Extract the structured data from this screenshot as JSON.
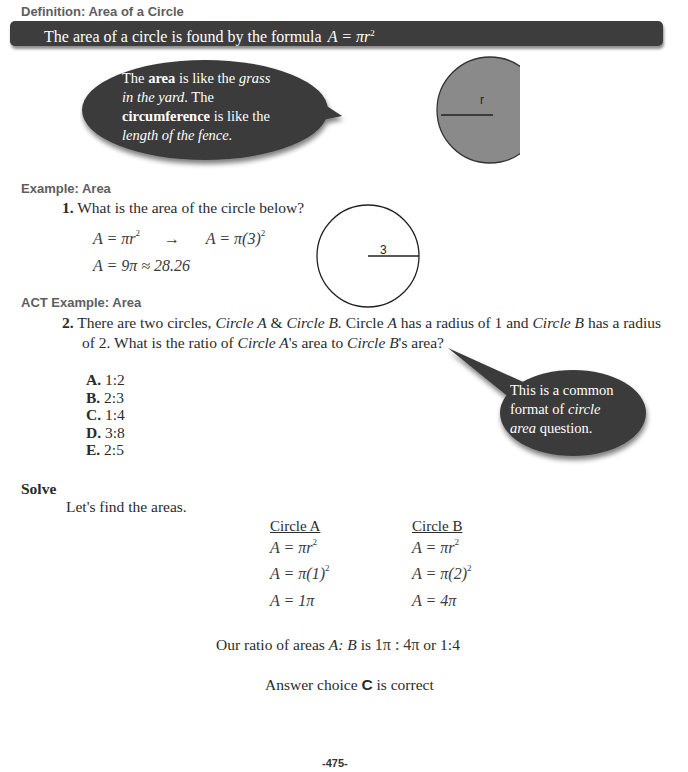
{
  "definition": {
    "heading": "Definition:  Area of a Circle",
    "bar_text": "The area of a circle is found by the formula",
    "bar_formula": "A = πr",
    "bar_formula_exp": "2"
  },
  "callout_1": {
    "line1_pre": "The ",
    "line1_bold": "area",
    "line1_mid": " is like the ",
    "line1_ital": "grass",
    "line2_ital": "in the yard",
    "line2_post": ".  The",
    "line3_bold": "circumference",
    "line3_post": " is like the",
    "line4_ital": "length of the fence."
  },
  "figure_1": {
    "label": "r",
    "fill": "#8a8a8a"
  },
  "example": {
    "heading": "Example:  Area",
    "number": "1.",
    "question": "What is the area of the circle below?",
    "step1_left": "A = πr",
    "step1_exp": "2",
    "arrow": "→",
    "step1_right": "A = π(3)",
    "step1_right_exp": "2",
    "step2": "A = 9π ≈ 28.26",
    "figure_label": "3"
  },
  "act_example": {
    "heading": "ACT Example:  Area",
    "number": "2.",
    "q_p1": "There are two circles, ",
    "q_circleA": "Circle A",
    "q_p2": " & ",
    "q_circleB": "Circle B.",
    "q_p3": "  Circle ",
    "q_A": "A",
    "q_p4": " has a radius of 1 and ",
    "q_circleB2": "Circle B",
    "q_p5": " has a radius",
    "q_line2_p1": "of 2.  What is the ratio of ",
    "q_line2_circleA": "Circle A",
    "q_line2_p2": "'s area to ",
    "q_line2_circleB": "Circle B",
    "q_line2_p3": "'s area?",
    "choices": [
      {
        "letter": "A.",
        "value": "1:2"
      },
      {
        "letter": "B.",
        "value": "2:3"
      },
      {
        "letter": "C.",
        "value": "1:4"
      },
      {
        "letter": "D.",
        "value": "3:8"
      },
      {
        "letter": "E.",
        "value": "2:5"
      }
    ]
  },
  "callout_2": {
    "line1": "This is a common",
    "line2_pre": "format of ",
    "line2_ital": "circle",
    "line3_ital": "area",
    "line3_post": " question."
  },
  "solve": {
    "heading": "Solve",
    "intro": "Let's find the areas.",
    "col_a": {
      "title": "Circle A",
      "line1": "A = πr",
      "line1_exp": "2",
      "line2": "A = π(1)",
      "line2_exp": "2",
      "line3": "A = 1π"
    },
    "col_b": {
      "title": "Circle B",
      "line1": "A = πr",
      "line1_exp": "2",
      "line2": "A = π(2)",
      "line2_exp": "2",
      "line3": "A = 4π"
    },
    "ratio_pre": "Our ratio of areas ",
    "ratio_AB": "A: B",
    "ratio_is": " is ",
    "ratio_math": "1π : 4π",
    "ratio_post": " or 1:4",
    "answer_pre": "Answer choice  ",
    "answer_letter": "C",
    "answer_post": " is correct"
  },
  "page_number": "-475-"
}
